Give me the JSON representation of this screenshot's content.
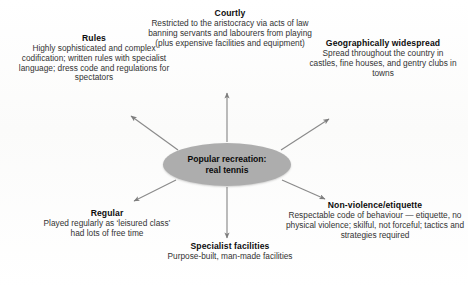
{
  "diagram": {
    "type": "mind-map",
    "centre": {
      "label": "Popular recreation:\nreal tennis",
      "fill_color": "#adadad"
    },
    "background_color": "#fdfdfd",
    "arrow_color": "#8a8a8a",
    "nodes": [
      {
        "id": "rules",
        "title": "Rules",
        "body": "Highly sophisticated and complex codification; written rules with specialist language; dress code and regulations for spectators",
        "direction": "upper-left"
      },
      {
        "id": "courtly",
        "title": "Courtly",
        "body": "Restricted to the aristocracy via acts of law banning servants and labourers from playing (plus expensive facilities and equipment)",
        "direction": "up"
      },
      {
        "id": "geographically-widespread",
        "title": "Geographically widespread",
        "body": "Spread throughout the country in castles, fine houses, and gentry clubs in towns",
        "direction": "upper-right"
      },
      {
        "id": "non-violence-etiquette",
        "title": "Non-violence/etiquette",
        "body": "Respectable code of behaviour — etiquette, no physical violence; skilful, not forceful; tactics and strategies required",
        "direction": "lower-right"
      },
      {
        "id": "specialist-facilities",
        "title": "Specialist facilities",
        "body": "Purpose-built, man-made facilities",
        "direction": "down"
      },
      {
        "id": "regular",
        "title": "Regular",
        "body": "Played regularly as ‘leisured class’ had lots of free time",
        "direction": "lower-left"
      }
    ]
  }
}
